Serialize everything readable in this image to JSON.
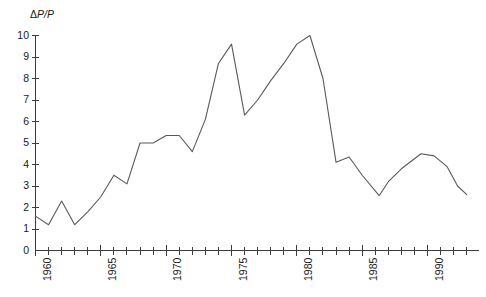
{
  "figure": {
    "axis_color": "#3d3d3d",
    "line_color": "#595959",
    "background": "#ffffff",
    "ylabel_delta": "Δ",
    "ylabel_p1": "P",
    "ylabel_slash": "/",
    "ylabel_p2": "P"
  },
  "chart_data": {
    "type": "line",
    "title": "",
    "subtitle": "",
    "xlabel": "",
    "ylabel": "ΔP/P",
    "grid": false,
    "legend": null,
    "xlim": [
      1960,
      1993
    ],
    "ylim": [
      0,
      10
    ],
    "ytick_labels": [
      "0",
      "1",
      "2",
      "3",
      "4",
      "5",
      "6",
      "7",
      "8",
      "9",
      "10"
    ],
    "ytick_values": [
      0,
      1,
      2,
      3,
      4,
      5,
      6,
      7,
      8,
      9,
      10
    ],
    "xtick_values": [
      1960,
      1961,
      1962,
      1963,
      1964,
      1965,
      1966,
      1967,
      1968,
      1969,
      1970,
      1971,
      1972,
      1973,
      1974,
      1975,
      1976,
      1977,
      1978,
      1979,
      1980,
      1981,
      1982,
      1983,
      1984,
      1985,
      1986,
      1987,
      1988,
      1989,
      1990,
      1991,
      1992,
      1993
    ],
    "xtick_labeled": [
      1960,
      1965,
      1970,
      1975,
      1980,
      1985,
      1990
    ],
    "xtick_labels": [
      "1960",
      "1965",
      "1970",
      "1975",
      "1980",
      "1985",
      "1990"
    ],
    "x": [
      1960,
      1961,
      1962,
      1963,
      1964,
      1965,
      1966,
      1967,
      1968,
      1969,
      1970,
      1971,
      1972,
      1973,
      1974,
      1975,
      1976,
      1977,
      1978,
      1979,
      1980,
      1981,
      1982,
      1983,
      1984,
      1985,
      1986.3,
      1987,
      1988,
      1989.5,
      1990.5,
      1991.5,
      1992.3,
      1993
    ],
    "values": [
      1.6,
      1.2,
      2.3,
      1.2,
      1.8,
      2.5,
      3.5,
      3.1,
      5.0,
      5.0,
      5.35,
      5.35,
      4.6,
      6.1,
      8.7,
      9.6,
      6.3,
      7.0,
      7.9,
      8.7,
      9.6,
      10.0,
      8.0,
      4.1,
      4.35,
      3.5,
      2.55,
      3.2,
      3.8,
      4.5,
      4.4,
      3.9,
      3.0,
      2.6
    ],
    "series": [
      {
        "name": "ΔP/P",
        "values": [
          1.6,
          1.2,
          2.3,
          1.2,
          1.8,
          2.5,
          3.5,
          3.1,
          5.0,
          5.0,
          5.35,
          5.35,
          4.6,
          6.1,
          8.7,
          9.6,
          6.3,
          7.0,
          7.9,
          8.7,
          9.6,
          10.0,
          8.0,
          4.1,
          4.35,
          3.5,
          2.55,
          3.2,
          3.8,
          4.5,
          4.4,
          3.9,
          3.0,
          2.6
        ]
      }
    ]
  }
}
